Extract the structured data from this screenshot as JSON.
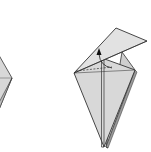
{
  "diagram": {
    "type": "origami-instruction",
    "steps": [
      {
        "id": "previous-step-partial",
        "description": "kite base shape, partially cropped at left edge"
      },
      {
        "id": "current-step",
        "description": "kite shape with top flap folded up and to the right; arrow indicating fold upward along center crease"
      }
    ],
    "colors": {
      "paper": "#d8d8d8",
      "paper_light": "#e6e6e6",
      "paper_shadow": "#bdbdbd",
      "line": "#333333",
      "background": "#ffffff"
    },
    "symbols": {
      "arrow": "fold-up-arrow",
      "dashed_line": "valley-fold-line"
    }
  }
}
